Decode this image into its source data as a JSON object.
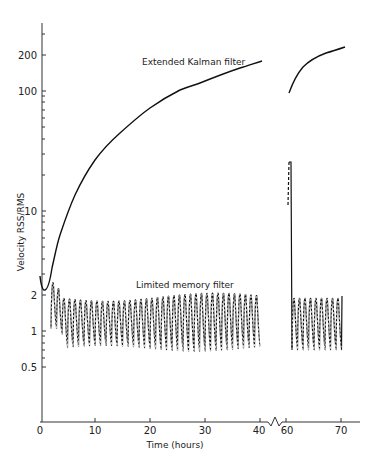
{
  "chart_data": {
    "type": "line",
    "title": "",
    "xlabel": "Time (hours)",
    "ylabel": "Velocity RSS/RMS",
    "yscale": "log",
    "xlim": [
      0,
      73
    ],
    "ylim": [
      0.17,
      370
    ],
    "x_axis_break": [
      40,
      60
    ],
    "grid": false,
    "legend": "inline labels",
    "x_ticks": [
      0,
      10,
      20,
      30,
      40,
      60,
      70
    ],
    "x_tick_labels": [
      "0",
      "10",
      "20",
      "30",
      "40",
      "60",
      "70"
    ],
    "y_ticks": [
      0.5,
      1,
      2,
      10,
      100,
      200
    ],
    "y_tick_labels": [
      "0.5",
      "1",
      "2",
      "10",
      "100",
      "200"
    ],
    "series": [
      {
        "name": "Extended Kalman filter",
        "style": "solid",
        "segments": [
          {
            "x": [
              0,
              0.7,
              2.2,
              3.6,
              6.4,
              10,
              14.5,
              20,
              25.5,
              29,
              36.4,
              40
            ],
            "y": [
              2.9,
              2.2,
              3.3,
              6.3,
              13.5,
              26.5,
              44,
              72,
              101,
              114,
              155,
              175
            ]
          },
          {
            "x": [
              60.5,
              62,
              64,
              66,
              68,
              70,
              71
            ],
            "y": [
              96,
              140,
              175,
              195,
              210,
              222,
              230
            ]
          }
        ]
      },
      {
        "name": "Limited memory filter",
        "style": "oscillating (solid with dashed envelope)",
        "period_hours": 1,
        "segments": [
          {
            "x_range": [
              2,
              40
            ],
            "peak": [
              2.5,
              1.9
            ],
            "trough": [
              1.1,
              0.7
            ],
            "note": "initial peak ~2.5, settling to ~1.8 peaks / ~0.75 troughs"
          },
          {
            "x_range": [
              60.5,
              61.5
            ],
            "spike_peak": 25,
            "spike_start": 12,
            "note": "spike after gap, dropping to ~0.7"
          },
          {
            "x_range": [
              61.5,
              71
            ],
            "peak": [
              1.8,
              1.9
            ],
            "trough": [
              0.7,
              0.7
            ]
          }
        ]
      }
    ],
    "annotations": [
      "Extended Kalman filter",
      "Limited memory filter"
    ]
  },
  "labels": {
    "ekf": "Extended Kalman filter",
    "lmf": "Limited memory filter",
    "xlabel": "Time (hours)",
    "ylabel": "Velocity  RSS/RMS",
    "xticks": [
      "0",
      "10",
      "20",
      "30",
      "40",
      "60",
      "70"
    ],
    "yticks": [
      "0.5",
      "1",
      "2",
      "10",
      "100",
      "200"
    ]
  }
}
